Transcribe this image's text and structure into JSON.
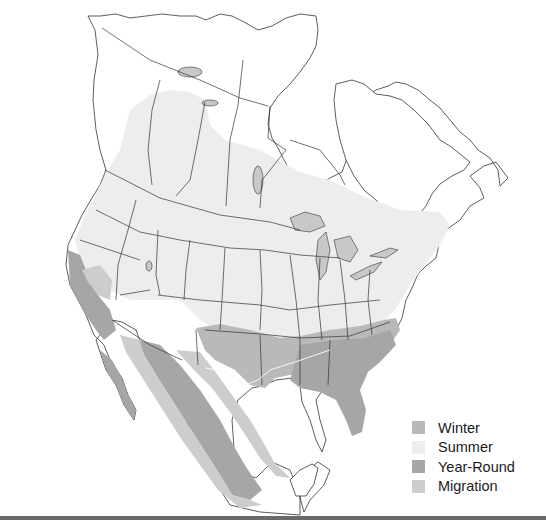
{
  "map": {
    "title": "",
    "region": "North America range map",
    "colors": {
      "background": "#ffffff",
      "land": "#ffffff",
      "border": "#333333",
      "lakes": "#c8c8c8",
      "winter": "#b9b9b9",
      "summer": "#ededed",
      "year_round": "#a6a6a6",
      "migration": "#cdcdcd"
    }
  },
  "legend": {
    "items": [
      {
        "label": "Winter",
        "color": "#b9b9b9"
      },
      {
        "label": "Summer",
        "color": "#ededed"
      },
      {
        "label": "Year-Round",
        "color": "#a6a6a6"
      },
      {
        "label": "Migration",
        "color": "#cdcdcd"
      }
    ]
  }
}
